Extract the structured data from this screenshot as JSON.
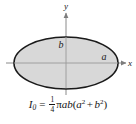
{
  "figure": {
    "type": "ellipse-cross-section-diagram",
    "background_color": "#ffffff",
    "shape": {
      "name": "ellipse",
      "fill_color": "#d8d8d8",
      "stroke_color": "#1a1a1a",
      "center_x": 66,
      "center_y": 63,
      "semi_axis_x": 52,
      "semi_axis_y": 26
    },
    "axes": {
      "x_axis_label": "x",
      "y_axis_label": "y",
      "axis_color": "#8a8a8a",
      "origin_x": 66,
      "origin_y": 63
    },
    "dimension_labels": {
      "semi_minor": "b",
      "semi_major": "a"
    },
    "formula": {
      "symbol": "I",
      "symbol_subscript": "0",
      "equals": "=",
      "fraction_numerator": "1",
      "fraction_denominator": "4",
      "pi": "π",
      "factor_a": "a",
      "factor_b": "b",
      "open_paren": "(",
      "term1_base": "a",
      "term1_exponent": "2",
      "plus": "+",
      "term2_base": "b",
      "term2_exponent": "2",
      "close_paren": ")",
      "plain_text": "I0 = 1/4 πab(a² + b²)"
    }
  }
}
